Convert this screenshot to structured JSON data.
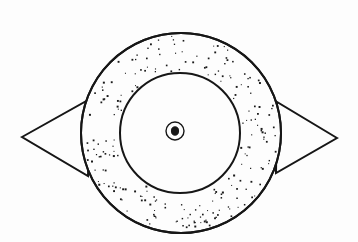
{
  "figure": {
    "canvas": {
      "width": 358,
      "height": 242,
      "background_color": "#fdfdfd"
    },
    "ink_color": "#161616",
    "stipple": {
      "dot_color": "#1a1a1a",
      "dot_size_px": 1.4,
      "density_per_1000px2": 11,
      "seed": 20240517,
      "description": "random square speckle fill in annulus band"
    },
    "shapes": {
      "outer_circle": {
        "name": "outer-circle",
        "cx": 181,
        "cy": 133,
        "r": 100,
        "fill": "stipple",
        "stroke_width": 2.0
      },
      "inner_circle": {
        "name": "inner-circle",
        "cx": 180,
        "cy": 133,
        "r": 60,
        "fill": "#fdfdfd",
        "stroke_width": 2.0
      },
      "center_ring": {
        "name": "center-ring",
        "cx": 175,
        "cy": 131,
        "r": 9,
        "fill": "#fdfdfd",
        "stroke_width": 1.4
      },
      "center_dot": {
        "name": "center-dot",
        "cx": 175,
        "cy": 131,
        "rx": 3.6,
        "ry": 4.2,
        "fill": "#161616"
      },
      "left_triangle": {
        "name": "left-triangle",
        "points": "22,137 90,99 88,176",
        "tip_x": 22,
        "tip_y": 137,
        "stroke_width": 2.0
      },
      "right_triangle": {
        "name": "right-triangle",
        "points": "337,138 277,102 276,173",
        "tip_x": 337,
        "tip_y": 138,
        "stroke_width": 2.0
      }
    }
  }
}
